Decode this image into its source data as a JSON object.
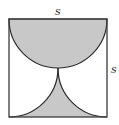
{
  "diagram": {
    "type": "geometry",
    "labels": {
      "top_side": "s",
      "right_side": "s"
    },
    "colors": {
      "shade": "#c8c8c8",
      "stroke": "#2a2a2a",
      "background": "#ffffff"
    },
    "square": {
      "x": 9,
      "y": 19,
      "size": 98
    },
    "semicircle": {
      "cx": 58,
      "cy": 19,
      "r": 49
    },
    "quarter_circles": [
      {
        "cx": 9,
        "cy": 68,
        "r": 49
      },
      {
        "cx": 107,
        "cy": 68,
        "r": 49
      }
    ]
  }
}
